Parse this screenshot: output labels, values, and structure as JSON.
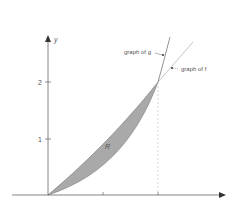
{
  "figure": {
    "axes": {
      "y_label": "y",
      "y_ticks": [
        {
          "value": 1,
          "label": "1"
        },
        {
          "value": 2,
          "label": "2"
        }
      ],
      "x_ticks": [
        1,
        2
      ]
    },
    "region_label": "R",
    "annotations": {
      "g": "graph of g",
      "f": "graph of f"
    },
    "colors": {
      "region_fill": "#a9a9a9",
      "axis": "#666666",
      "curve": "#777777",
      "line_f": "#b5b5b5",
      "dashed": "#bbbbbb"
    }
  }
}
